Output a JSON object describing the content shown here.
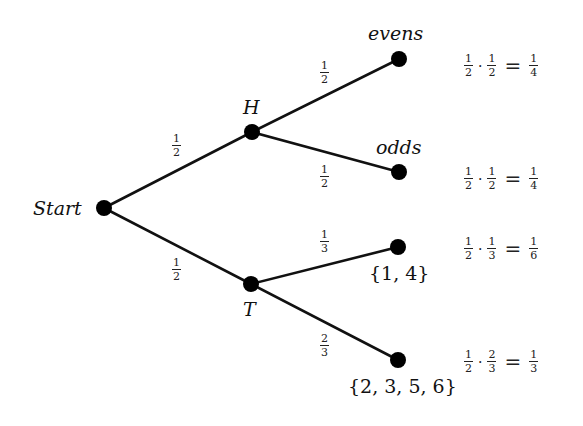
{
  "diagram": {
    "type": "probability-tree",
    "root": {
      "id": "start",
      "label": "Start",
      "x": 104,
      "y": 208
    },
    "level1": [
      {
        "id": "H",
        "label": "H",
        "x": 252,
        "y": 132,
        "edge_prob": {
          "num": "1",
          "den": "2"
        }
      },
      {
        "id": "T",
        "label": "T",
        "x": 251,
        "y": 284,
        "edge_prob": {
          "num": "1",
          "den": "2"
        }
      }
    ],
    "leaves": [
      {
        "id": "evens",
        "parent": "H",
        "label": "evens",
        "x": 399,
        "y": 59,
        "edge_prob": {
          "num": "1",
          "den": "2"
        },
        "calc": {
          "a": {
            "num": "1",
            "den": "2"
          },
          "op": "·",
          "b": {
            "num": "1",
            "den": "2"
          },
          "eq": "=",
          "result": {
            "num": "1",
            "den": "4"
          }
        }
      },
      {
        "id": "odds",
        "parent": "H",
        "label": "odds",
        "x": 399,
        "y": 172,
        "edge_prob": {
          "num": "1",
          "den": "2"
        },
        "calc": {
          "a": {
            "num": "1",
            "den": "2"
          },
          "op": "·",
          "b": {
            "num": "1",
            "den": "2"
          },
          "eq": "=",
          "result": {
            "num": "1",
            "den": "4"
          }
        }
      },
      {
        "id": "set14",
        "parent": "T",
        "label": "{1, 4}",
        "x": 398,
        "y": 247,
        "edge_prob": {
          "num": "1",
          "den": "3"
        },
        "calc": {
          "a": {
            "num": "1",
            "den": "2"
          },
          "op": "·",
          "b": {
            "num": "1",
            "den": "3"
          },
          "eq": "=",
          "result": {
            "num": "1",
            "den": "6"
          }
        }
      },
      {
        "id": "set2356",
        "parent": "T",
        "label": "{2, 3, 5, 6}",
        "x": 398,
        "y": 360,
        "edge_prob": {
          "num": "2",
          "den": "3"
        },
        "calc": {
          "a": {
            "num": "1",
            "den": "2"
          },
          "op": "·",
          "b": {
            "num": "2",
            "den": "3"
          },
          "eq": "=",
          "result": {
            "num": "1",
            "den": "3"
          }
        }
      }
    ],
    "colors": {
      "line": "#111111",
      "node": "#000000",
      "background": "#ffffff"
    }
  }
}
